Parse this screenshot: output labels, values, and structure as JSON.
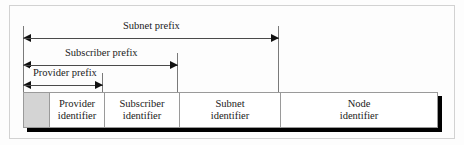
{
  "figure": {
    "colors": {
      "reserved_cell_fill": "#d4d4d4",
      "bar_border": "#9a9a9a",
      "bar_shadow": "#000000",
      "arrow": "#111111",
      "guide_line": "#7a7a7a",
      "outer_frame": "#d2d2d2",
      "page_background": "#fdfdfd",
      "text": "#1a1a1a"
    }
  },
  "measurements": [
    {
      "key": "subnet_prefix",
      "label": "Subnet prefix",
      "spans_fields": [
        "reserved",
        "provider_identifier",
        "subscriber_identifier",
        "subnet_identifier"
      ]
    },
    {
      "key": "subscriber_prefix",
      "label": "Subscriber prefix",
      "spans_fields": [
        "reserved",
        "provider_identifier",
        "subscriber_identifier"
      ]
    },
    {
      "key": "provider_prefix",
      "label": "Provider prefix",
      "spans_fields": [
        "reserved",
        "provider_identifier"
      ]
    }
  ],
  "address_bar": {
    "fields": [
      {
        "key": "reserved",
        "line1": "",
        "line2": "",
        "filled": true
      },
      {
        "key": "provider_identifier",
        "line1": "Provider",
        "line2": "identifier",
        "filled": false
      },
      {
        "key": "subscriber_identifier",
        "line1": "Subscriber",
        "line2": "identifier",
        "filled": false
      },
      {
        "key": "subnet_identifier",
        "line1": "Subnet",
        "line2": "identifier",
        "filled": false
      },
      {
        "key": "node_identifier",
        "line1": "Node",
        "line2": "identifier",
        "filled": false
      }
    ]
  }
}
